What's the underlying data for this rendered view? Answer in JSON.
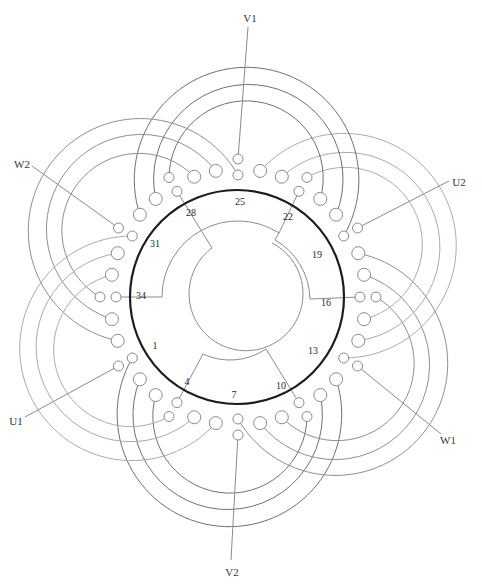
{
  "stator": {
    "slot_count": 36,
    "slot_labels": [
      "25",
      "28",
      "31",
      "34",
      "1",
      "4",
      "7",
      "10",
      "13",
      "16",
      "19",
      "22"
    ]
  },
  "terminals": [
    {
      "label": "V1",
      "slot": 25
    },
    {
      "label": "W2",
      "slot": 31
    },
    {
      "label": "U1",
      "slot": 1
    },
    {
      "label": "V2",
      "slot": 7
    },
    {
      "label": "W1",
      "slot": 13
    },
    {
      "label": "U2",
      "slot": 19
    }
  ],
  "colors": {
    "stator_outline": "#1c1c1c",
    "phase_u": "#707070",
    "phase_v": "#8f8f8f",
    "phase_w": "#ababab"
  }
}
